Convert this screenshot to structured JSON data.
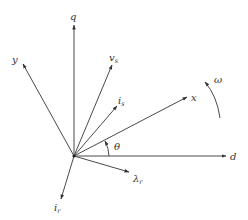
{
  "diagram": {
    "title": "",
    "origin": {
      "x": 74,
      "y": 156
    },
    "colors": {
      "line": "#4a4a4a",
      "text": "#333333",
      "background": "#ffffff"
    },
    "vectors": [
      {
        "id": "q",
        "label": "q",
        "subscript": "",
        "end": {
          "x": 74,
          "y": 24
        },
        "label_pos": {
          "x": 71,
          "y": 19
        }
      },
      {
        "id": "y",
        "label": "y",
        "subscript": "",
        "end": {
          "x": 22,
          "y": 63
        },
        "label_pos": {
          "x": 11,
          "y": 63
        }
      },
      {
        "id": "v_s",
        "label": "v",
        "subscript": "s",
        "end": {
          "x": 112,
          "y": 64
        },
        "label_pos": {
          "x": 110,
          "y": 60
        }
      },
      {
        "id": "i_s",
        "label": "i",
        "subscript": "s",
        "end": {
          "x": 117,
          "y": 105
        },
        "label_pos": {
          "x": 118,
          "y": 103
        }
      },
      {
        "id": "x",
        "label": "x",
        "subscript": "",
        "end": {
          "x": 188,
          "y": 97
        },
        "label_pos": {
          "x": 192,
          "y": 100
        }
      },
      {
        "id": "d",
        "label": "d",
        "subscript": "",
        "end": {
          "x": 226,
          "y": 156
        },
        "label_pos": {
          "x": 230,
          "y": 160
        }
      },
      {
        "id": "lambda_r",
        "label": "λ",
        "subscript": "r",
        "end": {
          "x": 129,
          "y": 172
        },
        "label_pos": {
          "x": 133,
          "y": 182
        }
      },
      {
        "id": "i_r",
        "label": "i",
        "subscript": "r",
        "end": {
          "x": 61,
          "y": 200
        },
        "label_pos": {
          "x": 55,
          "y": 211
        }
      }
    ],
    "angle": {
      "label": "θ",
      "label_pos": {
        "x": 114,
        "y": 150
      }
    },
    "rotation": {
      "label": "ω",
      "label_pos": {
        "x": 214,
        "y": 83
      }
    }
  }
}
